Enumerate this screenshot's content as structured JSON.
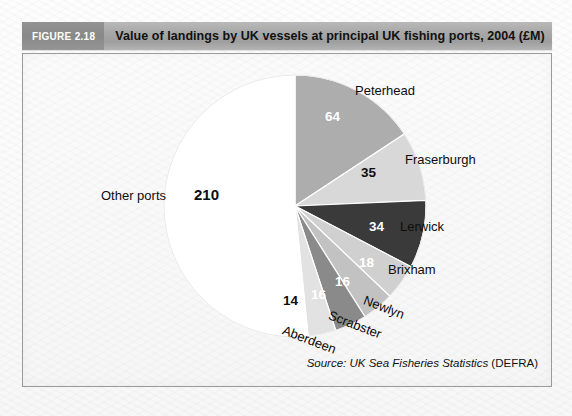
{
  "figure": {
    "chip_label": "FIGURE 2.18",
    "title": "Value of landings by UK vessels at principal UK fishing ports, 2004 (£M)",
    "source_prefix": "Source: UK Sea Fisheries Statistics",
    "source_suffix": "(DEFRA)"
  },
  "chart_data": {
    "type": "pie",
    "title": "Value of landings by UK vessels at principal UK fishing ports, 2004 (£M)",
    "unit": "£M",
    "total": 407,
    "start_angle_deg": 0,
    "direction": "clockwise",
    "legend": "none",
    "categories": [
      "Peterhead",
      "Fraserburgh",
      "Lerwick",
      "Brixham",
      "Newlyn",
      "Scrabster",
      "Aberdeen",
      "Other ports"
    ],
    "values": [
      64,
      35,
      34,
      18,
      16,
      16,
      14,
      210
    ],
    "colors": [
      "#adadad",
      "#d8d8d8",
      "#3a3a3a",
      "#d0d0d0",
      "#c2c2c2",
      "#8a8a8a",
      "#e2e2e2",
      "#ffffff"
    ],
    "label_colors": [
      "#ffffff",
      "#111111",
      "#ffffff",
      "#ffffff",
      "#ffffff",
      "#ffffff",
      "#111111",
      "#111111"
    ],
    "slices": [
      {
        "name": "Peterhead",
        "value": 64,
        "value_text": "64",
        "color": "#adadad",
        "label_color": "#ffffff"
      },
      {
        "name": "Fraserburgh",
        "value": 35,
        "value_text": "35",
        "color": "#d8d8d8",
        "label_color": "#111111"
      },
      {
        "name": "Lerwick",
        "value": 34,
        "value_text": "34",
        "color": "#3a3a3a",
        "label_color": "#ffffff"
      },
      {
        "name": "Brixham",
        "value": 18,
        "value_text": "18",
        "color": "#d0d0d0",
        "label_color": "#ffffff"
      },
      {
        "name": "Newlyn",
        "value": 16,
        "value_text": "16",
        "color": "#c2c2c2",
        "label_color": "#ffffff"
      },
      {
        "name": "Scrabster",
        "value": 16,
        "value_text": "16",
        "color": "#8a8a8a",
        "label_color": "#ffffff"
      },
      {
        "name": "Aberdeen",
        "value": 14,
        "value_text": "14",
        "color": "#e2e2e2",
        "label_color": "#111111"
      },
      {
        "name": "Other ports",
        "value": 210,
        "value_text": "210",
        "color": "#ffffff",
        "label_color": "#111111"
      }
    ]
  },
  "labels": {
    "peterhead": "Peterhead",
    "fraserburgh": "Fraserburgh",
    "lerwick": "Lerwick",
    "brixham": "Brixham",
    "newlyn": "Newlyn",
    "scrabster": "Scrabster",
    "aberdeen": "Aberdeen",
    "other_ports": "Other ports"
  },
  "values": {
    "peterhead": "64",
    "fraserburgh": "35",
    "lerwick": "34",
    "brixham": "18",
    "newlyn": "16",
    "scrabster": "16",
    "aberdeen": "14",
    "other_ports": "210"
  }
}
